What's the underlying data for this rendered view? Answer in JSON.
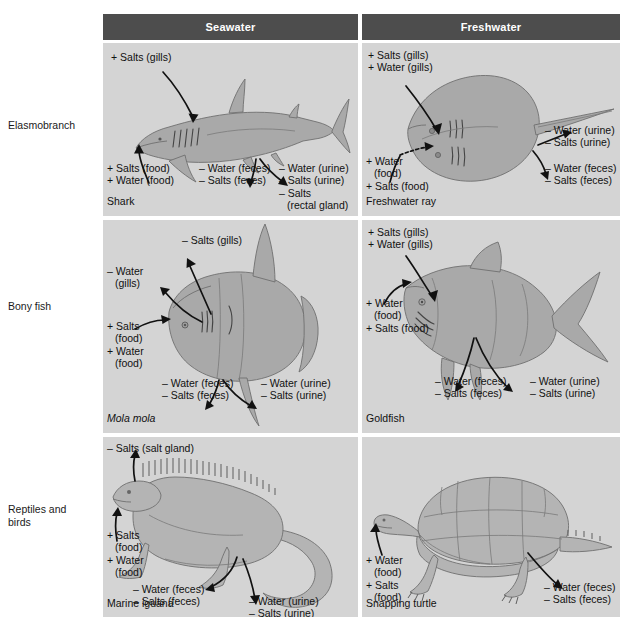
{
  "figure": {
    "type": "comparison-table-diagram",
    "columns": [
      "Seawater",
      "Freshwater"
    ],
    "row_labels": [
      "Elasmobranch",
      "Bony fish",
      "Reptiles and birds"
    ],
    "colors": {
      "header_bg": "#4d4d4d",
      "header_text": "#ffffff",
      "cell_bg": "#d4d4d4",
      "page_bg": "#ffffff",
      "animal_fill": "#a9a9a9",
      "animal_stroke": "#6f6f6f",
      "text": "#111111"
    }
  },
  "header": {
    "seawater": "Seawater",
    "freshwater": "Freshwater"
  },
  "rows": [
    {
      "label": "Elasmobranch",
      "seawater": {
        "organism": "Shark",
        "fluxes": [
          {
            "id": "gills",
            "lines": [
              "+ Salts (gills)"
            ]
          },
          {
            "id": "food",
            "lines": [
              "+ Salts (food)",
              "+ Water (food)"
            ]
          },
          {
            "id": "feces",
            "lines": [
              "– Water (feces)",
              "– Salts (feces)"
            ]
          },
          {
            "id": "urine",
            "lines": [
              "– Water (urine)",
              "– Salts (urine)",
              "– Salts",
              "(rectal gland)"
            ]
          }
        ]
      },
      "freshwater": {
        "organism": "Freshwater ray",
        "fluxes": [
          {
            "id": "gills",
            "lines": [
              "+ Salts (gills)",
              "+ Water (gills)"
            ]
          },
          {
            "id": "food",
            "lines": [
              "+ Water",
              "(food)",
              "+ Salts (food)"
            ]
          },
          {
            "id": "urine",
            "lines": [
              "– Water (urine)",
              "– Salts (urine)"
            ]
          },
          {
            "id": "feces",
            "lines": [
              "– Water (feces)",
              "– Salts (feces)"
            ]
          }
        ]
      }
    },
    {
      "label": "Bony fish",
      "seawater": {
        "organism": "Mola mola",
        "organism_italic": true,
        "fluxes": [
          {
            "id": "gills-salts",
            "lines": [
              "– Salts (gills)"
            ]
          },
          {
            "id": "gills-water",
            "lines": [
              "– Water",
              "(gills)"
            ]
          },
          {
            "id": "food",
            "lines": [
              "+ Salts",
              "(food)",
              "+ Water",
              "(food)"
            ]
          },
          {
            "id": "feces",
            "lines": [
              "– Water (feces)",
              "– Salts (feces)"
            ]
          },
          {
            "id": "urine",
            "lines": [
              "– Water (urine)",
              "– Salts (urine)"
            ]
          }
        ]
      },
      "freshwater": {
        "organism": "Goldfish",
        "fluxes": [
          {
            "id": "gills",
            "lines": [
              "+ Salts (gills)",
              "+ Water (gills)"
            ]
          },
          {
            "id": "food",
            "lines": [
              "+ Water",
              "(food)",
              "+ Salts (food)"
            ]
          },
          {
            "id": "feces",
            "lines": [
              "– Water (feces)",
              "– Salts (feces)"
            ]
          },
          {
            "id": "urine",
            "lines": [
              "– Water (urine)",
              "– Salts (urine)"
            ]
          }
        ]
      }
    },
    {
      "label": "Reptiles and birds",
      "seawater": {
        "organism": "Marine iguana",
        "fluxes": [
          {
            "id": "salt-gland",
            "lines": [
              "– Salts (salt gland)"
            ]
          },
          {
            "id": "food",
            "lines": [
              "+ Salts",
              "(food)",
              "+ Water",
              "(food)"
            ]
          },
          {
            "id": "feces",
            "lines": [
              "– Water (feces)",
              "– Salts (feces)"
            ]
          },
          {
            "id": "urine",
            "lines": [
              "– Water (urine)",
              "– Salts (urine)"
            ]
          }
        ]
      },
      "freshwater": {
        "organism": "Snapping turtle",
        "fluxes": [
          {
            "id": "food",
            "lines": [
              "+ Water",
              "(food)",
              "+ Salts",
              "(food)"
            ]
          },
          {
            "id": "feces",
            "lines": [
              "– Water (feces)",
              "– Salts (feces)"
            ]
          }
        ]
      }
    }
  ],
  "labels": {
    "row0": "Elasmobranch",
    "row1": "Bony fish",
    "row2_line1": "Reptiles and",
    "row2_line2": "birds",
    "shark": {
      "name": "Shark",
      "gills": "+ Salts (gills)",
      "food1": "+ Salts (food)",
      "food2": "+ Water (food)",
      "feces1": "– Water (feces)",
      "feces2": "– Salts (feces)",
      "urine1": "– Water (urine)",
      "urine2": "– Salts (urine)",
      "urine3": "– Salts",
      "urine4": "(rectal gland)"
    },
    "ray": {
      "name": "Freshwater ray",
      "gills1": "+ Salts (gills)",
      "gills2": "+ Water (gills)",
      "food1": "+ Water",
      "food2": "(food)",
      "food3": "+ Salts (food)",
      "urine1": "– Water (urine)",
      "urine2": "– Salts (urine)",
      "feces1": "– Water (feces)",
      "feces2": "– Salts (feces)"
    },
    "mola": {
      "name": "Mola mola",
      "gills_salts": "– Salts (gills)",
      "gills_water1": "– Water",
      "gills_water2": "(gills)",
      "food1": "+ Salts",
      "food2": "(food)",
      "food3": "+ Water",
      "food4": "(food)",
      "feces1": "– Water (feces)",
      "feces2": "– Salts (feces)",
      "urine1": "– Water (urine)",
      "urine2": "– Salts (urine)"
    },
    "goldfish": {
      "name": "Goldfish",
      "gills1": "+ Salts (gills)",
      "gills2": "+ Water (gills)",
      "food1": "+ Water",
      "food2": "(food)",
      "food3": "+ Salts (food)",
      "feces1": "– Water (feces)",
      "feces2": "– Salts (feces)",
      "urine1": "– Water (urine)",
      "urine2": "– Salts (urine)"
    },
    "iguana": {
      "name": "Marine iguana",
      "gland": "– Salts (salt gland)",
      "food1": "+ Salts",
      "food2": "(food)",
      "food3": "+ Water",
      "food4": "(food)",
      "feces1": "– Water (feces)",
      "feces2": "– Salts (feces)",
      "urine1": "– Water (urine)",
      "urine2": "– Salts (urine)"
    },
    "turtle": {
      "name": "Snapping turtle",
      "food1": "+ Water",
      "food2": "(food)",
      "food3": "+ Salts",
      "food4": "(food)",
      "feces1": "– Water (feces)",
      "feces2": "– Salts (feces)"
    }
  }
}
